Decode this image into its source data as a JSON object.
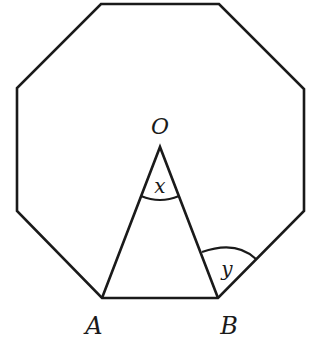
{
  "figure": {
    "shape": "regular-octagon",
    "stroke_color": "#1a1a1a",
    "background": "#ffffff"
  },
  "labels": {
    "center": "O",
    "vertex_a": "A",
    "vertex_b": "B",
    "angle_at_center": "x",
    "angle_at_b": "y"
  }
}
